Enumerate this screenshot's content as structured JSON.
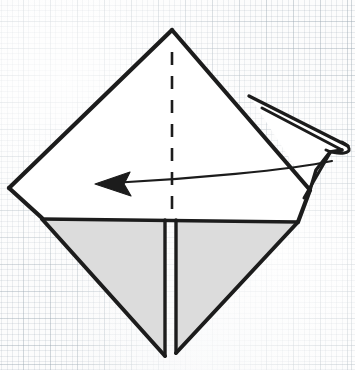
{
  "figure": {
    "kind": "origami-fold-diagram",
    "width": 355,
    "height": 370,
    "background": {
      "name": "graph-paper",
      "paper_color": "#fcfcfc",
      "minor_grid_color": "#8796a5",
      "major_grid_color": "#96a5af",
      "minor_grid_spacing": 5.4,
      "major_grid_spacing": 27
    },
    "palette": {
      "ink": "#1c1c1c",
      "paper_front": "#ffffff",
      "paper_back": "#dcdcdc",
      "crease_dash": "#1c1c1c"
    },
    "line_weights": {
      "outline": 4.2,
      "inner_edge": 3.2,
      "thin_edge": 2.2,
      "crease_dash": 2.4,
      "arrow_shaft": 2.0
    },
    "shapes": {
      "upper_front_panel": {
        "label": "upper-front-panel",
        "fill": "#ffffff",
        "points": "172,30 310,190 298,222 42,218 9,188"
      },
      "lower_left_back_panel": {
        "label": "lower-left-back-panel",
        "fill": "#dcdcdc",
        "points": "42,219 165,219 165,356 "
      },
      "lower_right_back_panel": {
        "label": "lower-right-back-panel",
        "fill": "#dcdcdc",
        "points": "176,220 298,222 176,353"
      },
      "right_flap_sliver": {
        "label": "right-flap-sliver",
        "fill": "#ffffff",
        "points": "252,100 345,142 349,150 331,152 310,190"
      },
      "right_flap_tip_loop": {
        "label": "right-flap-tip-loop",
        "fill": "#ffffff",
        "path": "M 286,122 C 312,128 340,136 347,144 C 352,150 344,154 331,151 C 315,146 296,134 286,122 Z"
      }
    },
    "edges": {
      "top_left_edge": "M 172,30 L 9,188",
      "top_right_edge": "M 172,30 L 310,190",
      "left_lower_edge": "M 9,188 L 42,218",
      "horizontal_fold_line": "M 42,219 L 298,222",
      "right_lower_edge": "M 310,190 L 298,222",
      "lower_left_diagonal": "M 42,219 L 165,356",
      "lower_right_diagonal": "M 298,222 L 176,353",
      "center_split_left": "M 165,220 L 165,356",
      "center_split_right": "M 176,220 L 176,353",
      "flap_upper_edge": "M 249,96 L 348,146",
      "flap_lower_edge": "M 262,108 L 342,150",
      "flap_corner_notch": "M 342,150 L 330,152 L 316,170 L 310,190",
      "flap_return_edge": "M 331,152 L 306,196"
    },
    "crease": {
      "name": "valley-fold-crease",
      "style": "dashed",
      "path": "M 172,52 L 172,222",
      "dash_pattern": "13 11"
    },
    "arrow": {
      "name": "fold-direction-arrow",
      "direction": "left",
      "shaft_path": "M 332,161 C 290,170 190,179 112,183",
      "tail_point": [
        332,
        161
      ],
      "head_point": [
        95,
        184
      ],
      "head_polygon": "95,184 130,172 124,184 131,196"
    },
    "labels": {
      "step_caption": "",
      "annotations": []
    }
  }
}
